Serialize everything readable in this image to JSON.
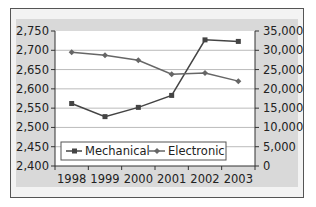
{
  "chart_data": {
    "type": "line",
    "title": "",
    "categories": [
      "1998",
      "1999",
      "2000",
      "2001",
      "2002",
      "2003"
    ],
    "series": [
      {
        "name": "Mechanical",
        "axis": "left",
        "values": [
          2562,
          2528,
          2552,
          2583,
          2727,
          2723
        ],
        "color": "#444444",
        "marker": "square"
      },
      {
        "name": "Electronic",
        "axis": "right",
        "values": [
          29500,
          28700,
          27400,
          23800,
          24100,
          22000
        ],
        "color": "#666666",
        "marker": "diamond"
      }
    ],
    "left_axis": {
      "ylim": [
        2400,
        2750
      ],
      "ticks": [
        "2,400",
        "2,450",
        "2,500",
        "2,550",
        "2,600",
        "2,650",
        "2,700",
        "2,750"
      ]
    },
    "right_axis": {
      "ylim": [
        0,
        35000
      ],
      "ticks": [
        "0",
        "5,000",
        "10,000",
        "15,000",
        "20,000",
        "25,000",
        "30,000",
        "35,000"
      ]
    },
    "xlabel": "",
    "ylabel": "",
    "grid": true,
    "legend": {
      "position": "inside-bottom",
      "entries": [
        "Mechanical",
        "Electronic"
      ]
    }
  }
}
